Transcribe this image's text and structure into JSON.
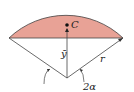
{
  "diagram": {
    "colors": {
      "segment_fill": "#e8a296",
      "stroke": "#333333",
      "background": "#ffffff"
    },
    "labels": {
      "centroid": "C",
      "ybar": "ȳ",
      "radius": "r",
      "angle": "2α"
    }
  }
}
